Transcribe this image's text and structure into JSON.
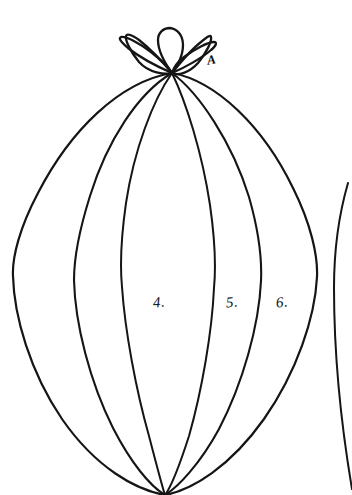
{
  "figure": {
    "kind": "hand-drawn-botanical-line-illustration",
    "background_color": "#ffffff",
    "ink_color": "#151515",
    "canvas": {
      "width": 352,
      "height": 495
    }
  },
  "nodes": {
    "apex": {
      "label": "top-convergence-node",
      "x": 172,
      "y": 73
    },
    "base": {
      "label": "bottom-convergence-node",
      "x": 165,
      "y": 495
    }
  },
  "annotations": [
    {
      "id": "A",
      "text": "A",
      "x": 207,
      "y": 52,
      "kind": "letter",
      "refers_to": "upper-right-sepal"
    },
    {
      "id": "4",
      "text": "4.",
      "x": 153,
      "y": 294,
      "kind": "number",
      "refers_to": "segment-left-of-center"
    },
    {
      "id": "5",
      "text": "5.",
      "x": 226,
      "y": 294,
      "kind": "number",
      "refers_to": "segment-right-of-center"
    },
    {
      "id": "6",
      "text": "6.",
      "x": 276,
      "y": 294,
      "kind": "number",
      "refers_to": "outer-right-segment"
    }
  ],
  "sepals": {
    "count": 5,
    "description": "five narrow pointed petals radiating upward and outward from the apex node",
    "tips": [
      {
        "name": "sepal-left-lower",
        "x": 122,
        "y": 46
      },
      {
        "name": "sepal-left-upper",
        "x": 126,
        "y": 36
      },
      {
        "name": "sepal-center",
        "x": 170,
        "y": 28
      },
      {
        "name": "sepal-right-upper",
        "x": 210,
        "y": 36
      },
      {
        "name": "sepal-right-lower",
        "x": 214,
        "y": 47
      }
    ]
  },
  "meridians": {
    "count": 6,
    "description": "six curved meridian lines joining the apex node to the base node, forming the segmented body",
    "widest_extent": {
      "left_x": 13,
      "right_x": 318,
      "at_y": 275
    },
    "crossings_at_y_303": [
      14,
      74,
      122,
      214,
      261,
      317
    ]
  },
  "neighbor_figure": {
    "description": "partial arc of an adjacent drawing entering at the right edge",
    "start": {
      "x": 348,
      "y": 183
    },
    "end": {
      "x": 352,
      "y": 495
    }
  }
}
